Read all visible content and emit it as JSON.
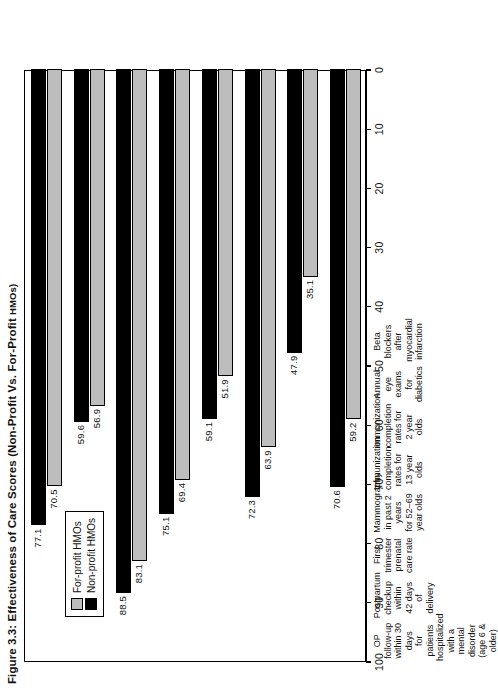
{
  "figure": {
    "title": "Figure 3.3: Effectiveness of Care Scores (Non-Profit Vs. For-Profit HMOs)",
    "title_main": "Figure 3.3: Effectiveness of Care Scores (Non-Profit Vs. For-Profit ",
    "title_smallcaps": "HMOs)"
  },
  "legend": {
    "position": "inside-plot-left",
    "items": [
      {
        "label": "For-profit HMOs",
        "color": "#bdbdbd"
      },
      {
        "label": "Non-profit HMOs",
        "color": "#000000"
      }
    ]
  },
  "axis": {
    "ticks": [
      "100",
      "90",
      "80",
      "70",
      "60",
      "50",
      "40",
      "30",
      "20",
      "10",
      "0"
    ]
  },
  "chart_data": {
    "type": "bar",
    "orientation": "horizontal",
    "title": "Figure 3.3: Effectiveness of Care Scores (Non-Profit Vs. For-Profit HMOs)",
    "xlabel": "",
    "ylabel": "",
    "xlim": [
      0,
      100
    ],
    "axis_direction": "descending",
    "grid": false,
    "legend_position": "inside-plot-left",
    "categories": [
      "Beta blockers after myocardial infarction",
      "Annual eye exams for diabetics",
      "Immunization completion rates for 2 year olds",
      "Immunization completion rates for 13 year olds",
      "Mammography in past 2 years for 52–69 year olds",
      "First trimester prenatal care rate",
      "Postpartum checkup within 42 days of delivery",
      "OP follow-up within 30 days for patients hospitalized with a mental disorder (age 6 & older)"
    ],
    "category_lines": [
      [
        "Beta blockers",
        "after",
        "myocardial",
        "infarction"
      ],
      [
        "Annual",
        "eye exams",
        "for",
        "diabetics"
      ],
      [
        "Immunization",
        "completion",
        "rates for",
        "2 year olds"
      ],
      [
        "Immunization",
        "completion",
        "rates for",
        "13 year olds"
      ],
      [
        "Mammography",
        "in past 2 years",
        "for 52–69",
        "year olds"
      ],
      [
        "First",
        "trimester",
        "prenatal",
        "care rate"
      ],
      [
        "Postpartum",
        "checkup",
        "within",
        "42 days",
        "of delivery"
      ],
      [
        "OP follow-up",
        "within 30 days",
        "for patients",
        "hospitalized",
        "with a",
        "mental disorder",
        "(age 6 & older)"
      ]
    ],
    "series": [
      {
        "name": "For-profit HMOs",
        "color": "#bdbdbd",
        "values": [
          59.2,
          35.1,
          63.9,
          51.9,
          69.4,
          83.1,
          56.9,
          70.5
        ]
      },
      {
        "name": "Non-profit HMOs",
        "color": "#000000",
        "values": [
          70.6,
          47.9,
          72.3,
          59.1,
          75.1,
          88.5,
          59.6,
          77.1
        ]
      }
    ]
  }
}
